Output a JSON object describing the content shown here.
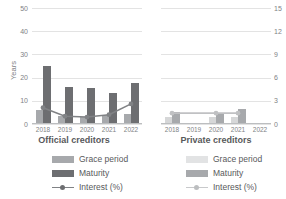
{
  "chart_data": {
    "type": "bar",
    "title": "",
    "panels": [
      {
        "name": "official",
        "title": "Official creditors",
        "categories": [
          "2018",
          "2019",
          "2020",
          "2021",
          "2022"
        ],
        "xlabel": "",
        "ylabel": "Years",
        "ylim": [
          0,
          50
        ],
        "yticks": [
          0,
          10,
          20,
          30,
          40,
          50
        ],
        "y2lim": [
          0,
          15
        ],
        "y2ticks": [
          0,
          3,
          6,
          9,
          12,
          15
        ],
        "grid": true,
        "series": [
          {
            "name": "Grace period",
            "axis": "left",
            "type": "bar",
            "values": [
              6.0,
              3.5,
              3.0,
              4.0,
              4.5
            ],
            "color": "#a7a9ac"
          },
          {
            "name": "Maturity",
            "axis": "left",
            "type": "bar",
            "values": [
              25.0,
              16.0,
              15.5,
              13.5,
              17.5
            ],
            "color": "#6d6e71"
          },
          {
            "name": "Interest (%)",
            "axis": "right",
            "type": "line",
            "values": [
              2.1,
              1.0,
              0.9,
              1.2,
              2.6
            ],
            "color": "#808285"
          }
        ]
      },
      {
        "name": "private",
        "title": "Private creditors",
        "categories": [
          "2018",
          "2019",
          "2020",
          "2021",
          "2022"
        ],
        "xlabel": "",
        "ylabel": "",
        "ylim": [
          0,
          50
        ],
        "yticks": [
          0,
          10,
          20,
          30,
          40,
          50
        ],
        "y2lim": [
          0,
          15
        ],
        "y2ticks": [
          0,
          3,
          6,
          9,
          12,
          15
        ],
        "grid": true,
        "series": [
          {
            "name": "Grace period",
            "axis": "left",
            "type": "bar",
            "values": [
              3.0,
              null,
              3.0,
              3.0,
              null
            ],
            "color": "#d6d7d8"
          },
          {
            "name": "Maturity",
            "axis": "left",
            "type": "bar",
            "values": [
              5.0,
              null,
              4.5,
              6.5,
              null
            ],
            "color": "#a7a9ac"
          },
          {
            "name": "Interest (%)",
            "axis": "right",
            "type": "line",
            "values": [
              1.4,
              null,
              1.4,
              1.4,
              null
            ],
            "color": "#c0c1c3"
          }
        ]
      }
    ]
  },
  "axes": {
    "left_label": "Years",
    "left_ticks": [
      "50",
      "40",
      "30",
      "20",
      "10",
      "0"
    ],
    "right_ticks": [
      "15",
      "12",
      "9",
      "6",
      "3",
      "0"
    ]
  },
  "legend": {
    "official": {
      "title": "Official creditors",
      "items": [
        {
          "label": "Grace period",
          "color": "#a7a9ac",
          "kind": "swatch"
        },
        {
          "label": "Maturity",
          "color": "#6d6e71",
          "kind": "swatch"
        },
        {
          "label": "Interest (%)",
          "color": "#808285",
          "kind": "line"
        }
      ]
    },
    "private": {
      "title": "Private creditors",
      "items": [
        {
          "label": "Grace period",
          "color": "#e2e3e4",
          "kind": "swatch"
        },
        {
          "label": "Maturity",
          "color": "#a7a9ac",
          "kind": "swatch"
        },
        {
          "label": "Interest (%)",
          "color": "#c8c9cb",
          "kind": "line"
        }
      ]
    }
  },
  "colors": {
    "grid": "#e3e3e3",
    "baseline": "#bcbec0",
    "text": "#58595b",
    "tick_text": "#808285",
    "background": "#ffffff"
  }
}
